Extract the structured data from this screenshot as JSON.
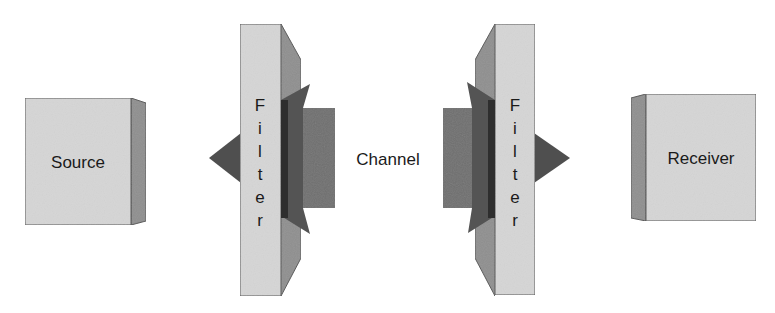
{
  "diagram": {
    "type": "communication-chain",
    "nodes": [
      {
        "id": "source",
        "label": "Source"
      },
      {
        "id": "filter-left",
        "label": "Filter",
        "letters": [
          "F",
          "i",
          "l",
          "t",
          "e",
          "r"
        ]
      },
      {
        "id": "channel",
        "label": "Channel"
      },
      {
        "id": "filter-right",
        "label": "Filter",
        "letters": [
          "F",
          "i",
          "l",
          "t",
          "e",
          "r"
        ]
      },
      {
        "id": "receiver",
        "label": "Receiver"
      }
    ],
    "colors": {
      "box_front": "#d6d6d6",
      "box_side": "#8f8f8f",
      "outline": "#555555",
      "arrow_body": "#707070",
      "arrow_head": "#545454",
      "arrow_shadow": "#2e2e2e",
      "text": "#1a1a1a"
    }
  }
}
